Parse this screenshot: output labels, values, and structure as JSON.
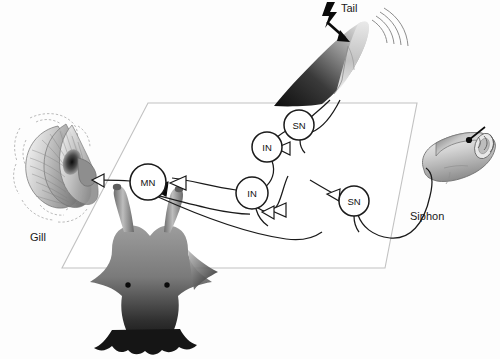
{
  "figure": {
    "background_color": "#fdfdfd",
    "line_color": "#1a1a1a",
    "plane_color": "#c9c9c9"
  },
  "labels": {
    "tail": "Tail",
    "gill": "Gill",
    "siphon": "Siphon"
  },
  "neurons": [
    {
      "id": "sn-tail",
      "label": "SN",
      "name": "sensory-neuron-tail",
      "cx": 299,
      "cy": 125,
      "r": 15
    },
    {
      "id": "in-upper",
      "label": "IN",
      "name": "interneuron-upper",
      "cx": 267,
      "cy": 147,
      "r": 15
    },
    {
      "id": "in-lower",
      "label": "IN",
      "name": "interneuron-lower",
      "cx": 252,
      "cy": 193,
      "r": 16
    },
    {
      "id": "sn-siphon",
      "label": "SN",
      "name": "sensory-neuron-siphon",
      "cx": 354,
      "cy": 201,
      "r": 15
    },
    {
      "id": "mn",
      "label": "MN",
      "name": "motor-neuron",
      "cx": 148,
      "cy": 182,
      "r": 18
    }
  ],
  "synapses": [
    {
      "name": "synapse-mn-to-gill",
      "type": "open",
      "note": "excitatory terminal onto gill"
    },
    {
      "name": "synapse-in-onto-mn",
      "type": "open",
      "note": "interneuron terminal onto motor neuron"
    },
    {
      "name": "synapse-facilitatory",
      "type": "filled",
      "note": "facilitatory interneuron terminal on MN"
    },
    {
      "name": "synapse-sn-tail-to-in",
      "type": "open",
      "note": "tail sensory neuron onto interneuron"
    },
    {
      "name": "synapse-sn-siphon-to-in",
      "type": "open",
      "note": "siphon sensory neuron onto interneuron"
    },
    {
      "name": "synapse-in-lower-out",
      "type": "open",
      "note": "lower interneuron output terminal"
    }
  ],
  "anatomy": [
    {
      "name": "gill-organ",
      "label": "Gill",
      "description": "striated gill leaflets with dashed ghost outline"
    },
    {
      "name": "siphon-organ",
      "label": "Siphon",
      "description": "tubular siphon with tactile probe stimulus"
    },
    {
      "name": "tail-organ",
      "label": "Tail",
      "description": "tail receiving electric shock stimulus"
    },
    {
      "name": "aplysia-body",
      "label": "",
      "description": "sea slug body with two rhinophores and two eyespots"
    }
  ],
  "stimuli": [
    {
      "name": "shock-bolt-icon",
      "target": "Tail",
      "type": "electric-shock"
    },
    {
      "name": "touch-probe-icon",
      "target": "Siphon",
      "type": "tactile-touch"
    }
  ],
  "caption": {
    "text": ""
  }
}
